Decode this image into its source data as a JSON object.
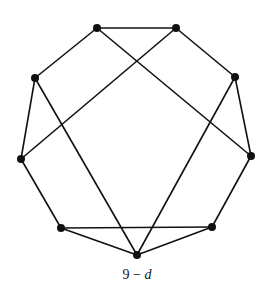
{
  "diagram": {
    "type": "graph",
    "caption": {
      "number": "9",
      "dash": "−",
      "variable": "d"
    },
    "stroke_color": "#111111",
    "vertex_color": "#111111",
    "vertices": [
      {
        "id": "top-left",
        "x": 97,
        "y": 28
      },
      {
        "id": "top-right",
        "x": 176,
        "y": 28
      },
      {
        "id": "upper-left",
        "x": 35,
        "y": 78
      },
      {
        "id": "upper-right",
        "x": 235,
        "y": 77
      },
      {
        "id": "mid-left",
        "x": 21,
        "y": 159
      },
      {
        "id": "mid-right",
        "x": 251,
        "y": 156
      },
      {
        "id": "lower-left",
        "x": 61,
        "y": 228
      },
      {
        "id": "lower-right",
        "x": 212,
        "y": 227
      },
      {
        "id": "bottom",
        "x": 137,
        "y": 255
      }
    ],
    "edges": [
      [
        "top-left",
        "top-right"
      ],
      [
        "top-left",
        "upper-left"
      ],
      [
        "top-left",
        "mid-right"
      ],
      [
        "top-right",
        "upper-right"
      ],
      [
        "top-right",
        "mid-left"
      ],
      [
        "upper-left",
        "mid-left"
      ],
      [
        "upper-left",
        "bottom"
      ],
      [
        "upper-right",
        "mid-right"
      ],
      [
        "upper-right",
        "bottom"
      ],
      [
        "mid-left",
        "lower-left"
      ],
      [
        "mid-right",
        "lower-right"
      ],
      [
        "lower-left",
        "lower-right"
      ],
      [
        "lower-left",
        "bottom"
      ],
      [
        "lower-right",
        "bottom"
      ]
    ]
  }
}
